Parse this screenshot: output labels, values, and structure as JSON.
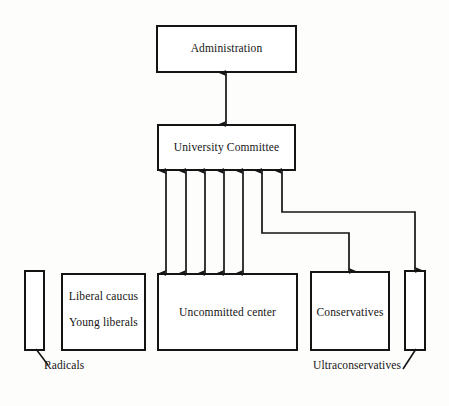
{
  "diagram": {
    "stroke_color": "#141414",
    "background_color": "#fdfdfb",
    "nodes": [
      {
        "id": "administration",
        "label": "Administration",
        "x": 157,
        "y": 26,
        "w": 139,
        "h": 46
      },
      {
        "id": "university",
        "label": "University Committee",
        "x": 158,
        "y": 125,
        "w": 137,
        "h": 45
      },
      {
        "id": "radicals",
        "label": "",
        "x": 25,
        "y": 271,
        "w": 19,
        "h": 79
      },
      {
        "id": "liberal",
        "label": "Liberal caucus",
        "x": 62,
        "y": 274,
        "w": 83,
        "h": 76
      },
      {
        "id": "uncommitted",
        "label": "Uncommitted center",
        "x": 158,
        "y": 274,
        "w": 139,
        "h": 76
      },
      {
        "id": "conservatives",
        "label": "Conservatives",
        "x": 311,
        "y": 272,
        "w": 78,
        "h": 78
      },
      {
        "id": "ultraconservatives",
        "label": "",
        "x": 405,
        "y": 271,
        "w": 20,
        "h": 79
      }
    ],
    "node_text": {
      "administration": "Administration",
      "university_committee": "University Committee",
      "liberal_caucus": "Liberal caucus",
      "young_liberals": "Young liberals",
      "uncommitted_center": "Uncommitted center",
      "conservatives": "Conservatives"
    },
    "callouts": {
      "radicals": "Radicals",
      "ultraconservatives": "Ultraconservatives"
    },
    "edges": [
      {
        "id": "admin-committee",
        "from": "university",
        "to": "administration",
        "style": "double-headed-vertical",
        "x": 226,
        "y1": 72,
        "y2": 125
      },
      {
        "id": "committee-uncommitted-1",
        "from": "university",
        "to": "uncommitted",
        "style": "double-headed-vertical",
        "x": 166,
        "y1": 170,
        "y2": 274
      },
      {
        "id": "committee-uncommitted-2",
        "from": "university",
        "to": "uncommitted",
        "style": "double-headed-vertical",
        "x": 186,
        "y1": 170,
        "y2": 274
      },
      {
        "id": "committee-uncommitted-3",
        "from": "university",
        "to": "uncommitted",
        "style": "double-headed-vertical",
        "x": 205,
        "y1": 170,
        "y2": 274
      },
      {
        "id": "committee-uncommitted-4",
        "from": "university",
        "to": "uncommitted",
        "style": "double-headed-vertical",
        "x": 224,
        "y1": 170,
        "y2": 274
      },
      {
        "id": "committee-uncommitted-5",
        "from": "university",
        "to": "uncommitted",
        "style": "double-headed-vertical",
        "x": 243,
        "y1": 170,
        "y2": 274
      },
      {
        "id": "committee-conservatives",
        "from": "university",
        "to": "conservatives",
        "style": "double-headed-elbow",
        "x1": 262,
        "y_elbow": 233,
        "x2": 349,
        "y_top": 170,
        "y_bottom": 272
      },
      {
        "id": "committee-ultraconservatives",
        "from": "university",
        "to": "ultraconservatives",
        "style": "double-headed-elbow",
        "x1": 282,
        "y_elbow": 212,
        "x2": 415,
        "y_top": 170,
        "y_bottom": 271
      }
    ],
    "leaders": [
      {
        "id": "radicals-leader",
        "from_x": 37,
        "from_y": 350,
        "to_x": 48,
        "to_y": 364
      },
      {
        "id": "ultraconservatives-leader",
        "from_x": 415,
        "from_y": 350,
        "to_x": 404,
        "to_y": 368
      }
    ]
  }
}
